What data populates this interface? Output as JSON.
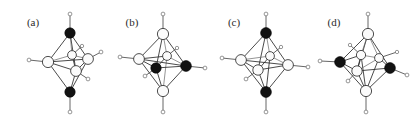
{
  "figure": {
    "background_color": "#ffffff",
    "width": 414,
    "height": 126,
    "caption_labels": [
      "(a)",
      "(b)",
      "(c)",
      "(d)"
    ],
    "legend_semantics": {
      "filled_vertex": "filled circle vertex atom",
      "open_vertex": "open circle vertex atom",
      "terminal_ligand": "small open circle terminal ligand"
    },
    "colors": {
      "filled_atom": "#121212",
      "open_atom": "#fbfbfb",
      "open_atom_stroke": "#3a3a3a",
      "cage_edge": "#2b2b2b",
      "faint_edge": "#666666",
      "ligand_bond": "#555555",
      "label_text": "#2a2a2a"
    }
  },
  "panels": [
    {
      "id": "panel-a",
      "label": "(a)",
      "label_x": 33,
      "label_y": 23,
      "center_x": 70,
      "center_y": 63,
      "filled_count": 2,
      "open_count": 4,
      "atoms": [
        {
          "name": "vertex-top",
          "x": 70,
          "y": 33,
          "r": 5.2,
          "type": "filled"
        },
        {
          "name": "vertex-bottom",
          "x": 70,
          "y": 92,
          "r": 5.2,
          "type": "filled"
        },
        {
          "name": "vertex-left",
          "x": 48,
          "y": 62,
          "r": 5.6,
          "type": "open"
        },
        {
          "name": "vertex-right",
          "x": 88,
          "y": 59,
          "r": 5.4,
          "type": "open"
        },
        {
          "name": "vertex-front",
          "x": 76,
          "y": 71,
          "r": 5.4,
          "type": "open"
        },
        {
          "name": "vertex-back",
          "x": 72,
          "y": 55,
          "r": 4.4,
          "type": "open"
        }
      ],
      "edges": [
        [
          0,
          2
        ],
        [
          0,
          3
        ],
        [
          0,
          4
        ],
        [
          0,
          5
        ],
        [
          1,
          2
        ],
        [
          1,
          3
        ],
        [
          1,
          4
        ],
        [
          2,
          3
        ],
        [
          2,
          4
        ],
        [
          2,
          5
        ],
        [
          3,
          4
        ],
        [
          3,
          5
        ],
        [
          4,
          5
        ]
      ],
      "faint_edges": [
        [
          0,
          5
        ],
        [
          3,
          5
        ],
        [
          2,
          5
        ]
      ],
      "ligands": [
        {
          "name": "ligand-top",
          "from": 0,
          "x": 70,
          "y": 14,
          "r": 1.9
        },
        {
          "name": "ligand-bottom",
          "from": 1,
          "x": 70,
          "y": 112,
          "r": 1.9
        },
        {
          "name": "ligand-left",
          "from": 2,
          "x": 29,
          "y": 60,
          "r": 1.9
        },
        {
          "name": "ligand-right",
          "from": 3,
          "x": 101,
          "y": 52,
          "r": 1.9
        },
        {
          "name": "ligand-front",
          "from": 4,
          "x": 88,
          "y": 79,
          "r": 1.9
        },
        {
          "name": "ligand-back",
          "from": 5,
          "x": 82,
          "y": 46,
          "r": 1.7
        }
      ]
    },
    {
      "id": "panel-b",
      "label": "(b)",
      "label_x": 132,
      "label_y": 23,
      "center_x": 163,
      "center_y": 63,
      "filled_count": 3,
      "open_count": 3,
      "atoms": [
        {
          "name": "vertex-top",
          "x": 163,
          "y": 34,
          "r": 5.6,
          "type": "open"
        },
        {
          "name": "vertex-bottom",
          "x": 163,
          "y": 91,
          "r": 5.6,
          "type": "open"
        },
        {
          "name": "vertex-left",
          "x": 139,
          "y": 59,
          "r": 5.4,
          "type": "open"
        },
        {
          "name": "vertex-right",
          "x": 186,
          "y": 66,
          "r": 5.4,
          "type": "filled"
        },
        {
          "name": "vertex-front",
          "x": 156,
          "y": 68,
          "r": 5.2,
          "type": "filled"
        },
        {
          "name": "vertex-back",
          "x": 167,
          "y": 56,
          "r": 4.4,
          "type": "open"
        }
      ],
      "edges": [
        [
          0,
          2
        ],
        [
          0,
          3
        ],
        [
          0,
          4
        ],
        [
          0,
          5
        ],
        [
          1,
          2
        ],
        [
          1,
          3
        ],
        [
          1,
          4
        ],
        [
          1,
          5
        ],
        [
          2,
          3
        ],
        [
          2,
          4
        ],
        [
          2,
          5
        ],
        [
          3,
          4
        ],
        [
          3,
          5
        ],
        [
          4,
          5
        ]
      ],
      "faint_edges": [
        [
          0,
          5
        ],
        [
          3,
          5
        ],
        [
          1,
          5
        ]
      ],
      "ligands": [
        {
          "name": "ligand-top",
          "from": 0,
          "x": 163,
          "y": 14,
          "r": 1.9
        },
        {
          "name": "ligand-bottom",
          "from": 1,
          "x": 163,
          "y": 112,
          "r": 1.9
        },
        {
          "name": "ligand-left",
          "from": 2,
          "x": 120,
          "y": 57,
          "r": 1.9
        },
        {
          "name": "ligand-right",
          "from": 3,
          "x": 205,
          "y": 68,
          "r": 1.9
        },
        {
          "name": "ligand-front",
          "from": 4,
          "x": 145,
          "y": 76,
          "r": 1.9
        },
        {
          "name": "ligand-back",
          "from": 5,
          "x": 177,
          "y": 48,
          "r": 1.7
        }
      ]
    },
    {
      "id": "panel-c",
      "label": "(c)",
      "label_x": 234,
      "label_y": 23,
      "center_x": 266,
      "center_y": 63,
      "filled_count": 2,
      "open_count": 4,
      "atoms": [
        {
          "name": "vertex-top",
          "x": 266,
          "y": 33,
          "r": 5.4,
          "type": "filled"
        },
        {
          "name": "vertex-bottom",
          "x": 266,
          "y": 92,
          "r": 5.4,
          "type": "filled"
        },
        {
          "name": "vertex-left",
          "x": 241,
          "y": 60,
          "r": 5.4,
          "type": "open"
        },
        {
          "name": "vertex-right",
          "x": 288,
          "y": 65,
          "r": 5.4,
          "type": "open"
        },
        {
          "name": "vertex-front",
          "x": 258,
          "y": 70,
          "r": 5.2,
          "type": "open"
        },
        {
          "name": "vertex-back",
          "x": 270,
          "y": 56,
          "r": 4.4,
          "type": "open"
        }
      ],
      "edges": [
        [
          0,
          2
        ],
        [
          0,
          3
        ],
        [
          0,
          4
        ],
        [
          0,
          5
        ],
        [
          1,
          2
        ],
        [
          1,
          3
        ],
        [
          1,
          4
        ],
        [
          1,
          5
        ],
        [
          2,
          3
        ],
        [
          2,
          4
        ],
        [
          2,
          5
        ],
        [
          3,
          4
        ],
        [
          3,
          5
        ],
        [
          4,
          5
        ]
      ],
      "faint_edges": [
        [
          0,
          5
        ],
        [
          3,
          5
        ],
        [
          2,
          5
        ]
      ],
      "ligands": [
        {
          "name": "ligand-top",
          "from": 0,
          "x": 266,
          "y": 14,
          "r": 1.9
        },
        {
          "name": "ligand-bottom",
          "from": 1,
          "x": 266,
          "y": 112,
          "r": 1.9
        },
        {
          "name": "ligand-left",
          "from": 2,
          "x": 222,
          "y": 58,
          "r": 1.9
        },
        {
          "name": "ligand-right",
          "from": 3,
          "x": 308,
          "y": 67,
          "r": 1.9
        },
        {
          "name": "ligand-front",
          "from": 4,
          "x": 246,
          "y": 79,
          "r": 1.9
        },
        {
          "name": "ligand-back",
          "from": 5,
          "x": 281,
          "y": 47,
          "r": 1.7
        }
      ]
    },
    {
      "id": "panel-d",
      "label": "(d)",
      "label_x": 334,
      "label_y": 23,
      "center_x": 366,
      "center_y": 63,
      "filled_count": 2,
      "open_count": 4,
      "atoms": [
        {
          "name": "vertex-top",
          "x": 368,
          "y": 34,
          "r": 5.6,
          "type": "open"
        },
        {
          "name": "vertex-bottom",
          "x": 366,
          "y": 91,
          "r": 5.6,
          "type": "open"
        },
        {
          "name": "vertex-left",
          "x": 340,
          "y": 62,
          "r": 5.4,
          "type": "filled"
        },
        {
          "name": "vertex-right",
          "x": 390,
          "y": 68,
          "r": 5.4,
          "type": "filled"
        },
        {
          "name": "vertex-front",
          "x": 357,
          "y": 71,
          "r": 5.2,
          "type": "open"
        },
        {
          "name": "vertex-back",
          "x": 361,
          "y": 55,
          "r": 4.6,
          "type": "open"
        },
        {
          "name": "vertex-inner",
          "x": 379,
          "y": 58,
          "r": 4.4,
          "type": "open"
        }
      ],
      "edges": [
        [
          0,
          2
        ],
        [
          0,
          3
        ],
        [
          0,
          4
        ],
        [
          0,
          5
        ],
        [
          0,
          6
        ],
        [
          1,
          2
        ],
        [
          1,
          3
        ],
        [
          1,
          4
        ],
        [
          1,
          5
        ],
        [
          1,
          6
        ],
        [
          2,
          4
        ],
        [
          2,
          5
        ],
        [
          3,
          4
        ],
        [
          3,
          6
        ],
        [
          4,
          5
        ],
        [
          4,
          6
        ],
        [
          5,
          6
        ]
      ],
      "faint_edges": [
        [
          0,
          5
        ],
        [
          0,
          6
        ],
        [
          5,
          6
        ],
        [
          4,
          6
        ]
      ],
      "ligands": [
        {
          "name": "ligand-top",
          "from": 0,
          "x": 368,
          "y": 14,
          "r": 1.9
        },
        {
          "name": "ligand-bottom",
          "from": 1,
          "x": 366,
          "y": 112,
          "r": 1.9
        },
        {
          "name": "ligand-left",
          "from": 2,
          "x": 320,
          "y": 61,
          "r": 1.9
        },
        {
          "name": "ligand-right",
          "from": 3,
          "x": 407,
          "y": 75,
          "r": 1.9
        },
        {
          "name": "ligand-front",
          "from": 4,
          "x": 348,
          "y": 81,
          "r": 1.9
        },
        {
          "name": "ligand-back",
          "from": 5,
          "x": 350,
          "y": 45,
          "r": 1.7
        },
        {
          "name": "ligand-inner",
          "from": 6,
          "x": 397,
          "y": 52,
          "r": 1.7
        }
      ]
    }
  ]
}
